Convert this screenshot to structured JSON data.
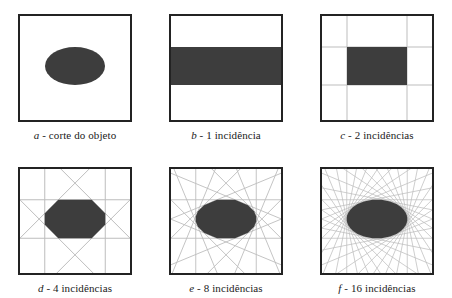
{
  "figure": {
    "colors": {
      "object_fill": "#3d3d3d",
      "frame_border": "#232323",
      "projection_line": "#b9b9b9",
      "background": "#ffffff",
      "caption_text": "#1a1a1a"
    }
  },
  "panels": [
    {
      "id": "a",
      "letter": "a",
      "separator": " - ",
      "description": "corte do objeto",
      "caption": "a - corte do objeto",
      "incidences": 0,
      "shape": "ellipse",
      "angles": []
    },
    {
      "id": "b",
      "letter": "b",
      "separator": " - ",
      "description": "1 incidência",
      "caption": "b - 1 incidência",
      "incidences": 1,
      "shape": "band",
      "angles": [
        0
      ]
    },
    {
      "id": "c",
      "letter": "c",
      "separator": " - ",
      "description": "2 incidências",
      "caption": "c - 2 incidências",
      "incidences": 2,
      "shape": "rectangle",
      "angles": [
        0,
        90
      ]
    },
    {
      "id": "d",
      "letter": "d",
      "separator": " - ",
      "description": "4 incidências",
      "caption": "d - 4 incidências",
      "incidences": 4,
      "shape": "hexagon",
      "angles": [
        0,
        45,
        90,
        135
      ]
    },
    {
      "id": "e",
      "letter": "e",
      "separator": " - ",
      "description": "8 incidências",
      "caption": "e - 8 incidências",
      "incidences": 8,
      "shape": "polygon-16",
      "angles": [
        0,
        22.5,
        45,
        67.5,
        90,
        112.5,
        135,
        157.5
      ]
    },
    {
      "id": "f",
      "letter": "f",
      "separator": " - ",
      "description": "16 incidências",
      "caption": "f - 16 incidências",
      "incidences": 16,
      "shape": "near-ellipse",
      "angles": [
        0,
        11.25,
        22.5,
        33.75,
        45,
        56.25,
        67.5,
        78.75,
        90,
        101.25,
        112.5,
        123.75,
        135,
        146.25,
        157.5,
        168.75
      ]
    }
  ],
  "chart_data": {
    "type": "diagram",
    "object": {
      "type": "ellipse",
      "center_x": 0.5,
      "center_y": 0.48,
      "semi_axis_x": 0.275,
      "semi_axis_y": 0.175
    },
    "series": [
      {
        "name": "a - corte do objeto",
        "incidences": 0,
        "reconstruction": "ellipse (objeto original)"
      },
      {
        "name": "b - 1 incidência",
        "incidences": 1,
        "reconstruction": "faixa horizontal"
      },
      {
        "name": "c - 2 incidências",
        "incidences": 2,
        "reconstruction": "retângulo"
      },
      {
        "name": "d - 4 incidências",
        "incidences": 4,
        "reconstruction": "hexágono/octógono"
      },
      {
        "name": "e - 8 incidências",
        "incidences": 8,
        "reconstruction": "polígono de 16 lados"
      },
      {
        "name": "f - 16 incidências",
        "incidences": 16,
        "reconstruction": "elipse aproximada"
      }
    ],
    "categories": [
      "a",
      "b",
      "c",
      "d",
      "e",
      "f"
    ],
    "values": [
      0,
      1,
      2,
      4,
      8,
      16
    ],
    "xlabel": "",
    "ylabel": "número de incidências",
    "legend": "none",
    "grid": false
  }
}
